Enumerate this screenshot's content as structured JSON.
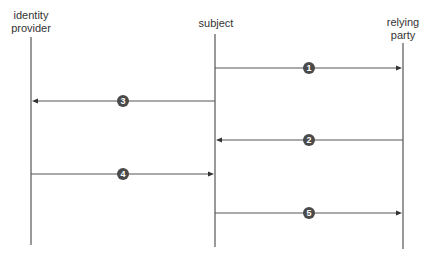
{
  "diagram": {
    "type": "sequence",
    "participants": [
      {
        "id": "idp",
        "label_lines": [
          "identity",
          "provider"
        ]
      },
      {
        "id": "subject",
        "label_lines": [
          "subject"
        ]
      },
      {
        "id": "rp",
        "label_lines": [
          "relying",
          "party"
        ]
      }
    ],
    "messages": [
      {
        "step": "1",
        "from": "subject",
        "to": "rp"
      },
      {
        "step": "3",
        "from": "subject",
        "to": "idp"
      },
      {
        "step": "2",
        "from": "rp",
        "to": "subject"
      },
      {
        "step": "4",
        "from": "idp",
        "to": "subject"
      },
      {
        "step": "5",
        "from": "subject",
        "to": "rp"
      }
    ],
    "colors": {
      "line": "#555555",
      "badge": "#4a4a4a",
      "badge_text": "#ffffff",
      "label": "#333333"
    }
  }
}
